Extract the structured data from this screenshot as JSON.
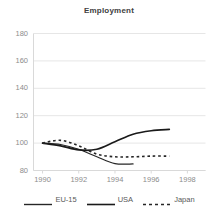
{
  "chart_data": {
    "type": "line",
    "title": "Employment",
    "xlabel": "",
    "ylabel": "",
    "xlim": [
      1989.5,
      1999
    ],
    "ylim": [
      80,
      180
    ],
    "grid": true,
    "legend_position": "bottom",
    "x_ticks": [
      "1990",
      "1992",
      "1994",
      "1996",
      "1998"
    ],
    "x_tick_values": [
      1990,
      1992,
      1994,
      1996,
      1998
    ],
    "y_ticks": [
      "80",
      "100",
      "120",
      "140",
      "160",
      "180"
    ],
    "y_tick_values": [
      80,
      100,
      120,
      140,
      160,
      180
    ],
    "series": [
      {
        "name": "EU-15",
        "style": "solid-thin",
        "color": "#262626",
        "x": [
          1990,
          1991,
          1992,
          1993,
          1994,
          1995
        ],
        "values": [
          100,
          99,
          95.5,
          90,
          85,
          84.8
        ]
      },
      {
        "name": "USA",
        "style": "solid-thick",
        "color": "#1a1a1a",
        "x": [
          1990,
          1991,
          1992,
          1993,
          1994,
          1995,
          1996,
          1997
        ],
        "values": [
          100,
          98,
          95,
          95.5,
          101,
          106.5,
          109,
          110
        ]
      },
      {
        "name": "Japan",
        "style": "dashed",
        "color": "#262626",
        "x": [
          1990,
          1991,
          1992,
          1993,
          1994,
          1995,
          1996,
          1997
        ],
        "values": [
          100,
          102,
          98,
          92,
          90,
          90,
          90.5,
          90.5
        ]
      }
    ]
  },
  "legend": {
    "items": [
      {
        "label": "EU-15",
        "swatch": "solid-line-swatch"
      },
      {
        "label": "USA",
        "swatch": "solid-line-swatch"
      },
      {
        "label": "Japan",
        "swatch": "dashed-line-swatch"
      }
    ]
  },
  "colors": {
    "axis": "#d9d9d9",
    "grid": "#e6e6e6",
    "tick_text": "#8c8c8c",
    "title_text": "#404040",
    "line": "#262626"
  }
}
